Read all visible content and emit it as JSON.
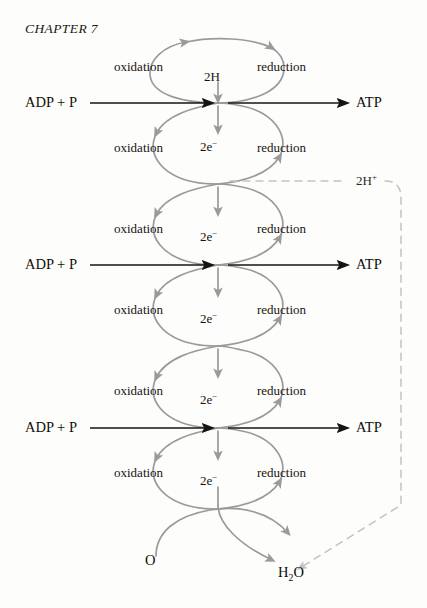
{
  "page": {
    "running_head": "CHAPTER 7",
    "background_color": "#fdfdfb",
    "width": 427,
    "height": 608
  },
  "diagram": {
    "title": "CHAPTER 7",
    "type": "electron-transport-chain-loop-diagram",
    "colors": {
      "loop_gray": "#9a9a9a",
      "arrow_black": "#141414",
      "dashed_gray": "#c2c2c2",
      "text": "#16130f"
    },
    "loops": [
      {
        "index": 1,
        "left_label": "oxidation",
        "right_label": "reduction",
        "carrier_label": "2H",
        "left_x": 150,
        "right_x": 288,
        "top_y": 62,
        "bottom_y": 103,
        "label_y": 66
      },
      {
        "index": 2,
        "left_label": "oxidation",
        "right_label": "reduction",
        "carrier_label": "2e⁻",
        "left_x": 150,
        "right_x": 288,
        "top_y": 103,
        "bottom_y": 184,
        "label_y": 147
      },
      {
        "index": 3,
        "left_label": "oxidation",
        "right_label": "reduction",
        "carrier_label": "2e⁻",
        "left_x": 150,
        "right_x": 288,
        "top_y": 184,
        "bottom_y": 265,
        "label_y": 228
      },
      {
        "index": 4,
        "left_label": "oxidation",
        "right_label": "reduction",
        "carrier_label": "2e⁻",
        "left_x": 150,
        "right_x": 288,
        "top_y": 265,
        "bottom_y": 346,
        "label_y": 309
      },
      {
        "index": 5,
        "left_label": "oxidation",
        "right_label": "reduction",
        "carrier_label": "2e⁻",
        "left_x": 150,
        "right_x": 288,
        "top_y": 346,
        "bottom_y": 428,
        "label_y": 390
      },
      {
        "index": 6,
        "left_label": "oxidation",
        "right_label": "reduction",
        "carrier_label": "2e⁻",
        "left_x": 150,
        "right_x": 288,
        "top_y": 428,
        "bottom_y": 509,
        "label_y": 471
      }
    ],
    "stage_labels": [
      {
        "text": "oxidation",
        "x": 114,
        "y": 66
      },
      {
        "text": "reduction",
        "x": 257,
        "y": 66
      },
      {
        "text": "oxidation",
        "x": 114,
        "y": 147
      },
      {
        "text": "reduction",
        "x": 257,
        "y": 147
      },
      {
        "text": "oxidation",
        "x": 114,
        "y": 228
      },
      {
        "text": "reduction",
        "x": 257,
        "y": 228
      },
      {
        "text": "oxidation",
        "x": 114,
        "y": 309
      },
      {
        "text": "reduction",
        "x": 257,
        "y": 309
      },
      {
        "text": "oxidation",
        "x": 114,
        "y": 390
      },
      {
        "text": "reduction",
        "x": 257,
        "y": 390
      },
      {
        "text": "oxidation",
        "x": 114,
        "y": 471
      },
      {
        "text": "reduction",
        "x": 257,
        "y": 471
      }
    ],
    "carrier_labels": [
      {
        "text": "2H",
        "html": "2H",
        "x": 204,
        "y": 76
      },
      {
        "text": "2e⁻",
        "html": "2e<span class=\"small-sup\">−</span>",
        "x": 200,
        "y": 146
      },
      {
        "text": "2e⁻",
        "html": "2e<span class=\"small-sup\">−</span>",
        "x": 200,
        "y": 236
      },
      {
        "text": "2e⁻",
        "html": "2e<span class=\"small-sup\">−</span>",
        "x": 200,
        "y": 318
      },
      {
        "text": "2e⁻",
        "html": "2e<span class=\"small-sup\">−</span>",
        "x": 200,
        "y": 399
      },
      {
        "text": "2e⁻",
        "html": "2e<span class=\"small-sup\">−</span>",
        "x": 200,
        "y": 480
      }
    ],
    "atp_rows": [
      {
        "substrate": "ADP + P",
        "product": "ATP",
        "y": 103,
        "substrate_x": 25,
        "product_x": 356
      },
      {
        "substrate": "ADP + P",
        "product": "ATP",
        "y": 265,
        "substrate_x": 25,
        "product_x": 356
      },
      {
        "substrate": "ADP + P",
        "product": "ATP",
        "y": 428,
        "substrate_x": 25,
        "product_x": 356
      }
    ],
    "proton_label": {
      "text": "2H+",
      "html": "2H<span class=\"small-sup\">+</span>",
      "x": 356,
      "y": 181
    },
    "oxygen_label": {
      "text": "O",
      "x": 145,
      "y": 561
    },
    "water_label": {
      "text": "H2O",
      "html": "H<span class=\"small-sub\">2</span>O",
      "x": 278,
      "y": 573
    }
  }
}
